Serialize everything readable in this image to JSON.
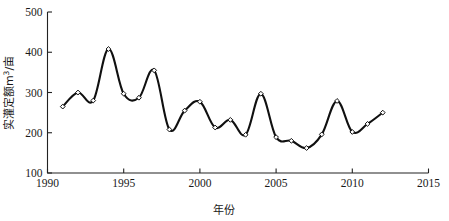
{
  "chart_data": {
    "type": "line",
    "title": "",
    "xlabel": "年份",
    "ylabel": "实灌定额m3/亩",
    "ylabel_base": "实灌定额m",
    "ylabel_sup": "3",
    "ylabel_tail": "/亩",
    "xlim": [
      1990,
      2015
    ],
    "ylim": [
      100,
      500
    ],
    "xticks": [
      1990,
      1995,
      2000,
      2005,
      2010,
      2015
    ],
    "xtick_labels": [
      "1990",
      "1995",
      "2000",
      "2005",
      "2010",
      "2015"
    ],
    "yticks": [
      100,
      200,
      300,
      400,
      500
    ],
    "ytick_labels": [
      "100",
      "200",
      "300",
      "400",
      "500"
    ],
    "grid": false,
    "legend": null,
    "marker": "diamond-open",
    "line_color": "#101010",
    "x": [
      1991,
      1992,
      1993,
      1994,
      1995,
      1996,
      1997,
      1998,
      1999,
      2000,
      2001,
      2002,
      2003,
      2004,
      2005,
      2006,
      2007,
      2008,
      2009,
      2010,
      2011,
      2012
    ],
    "values": [
      265,
      300,
      280,
      408,
      297,
      287,
      355,
      208,
      255,
      277,
      213,
      232,
      195,
      297,
      189,
      180,
      162,
      196,
      279,
      202,
      222,
      250
    ],
    "series": [
      {
        "name": "实灌定额",
        "values": [
          265,
          300,
          280,
          408,
          297,
          287,
          355,
          208,
          255,
          277,
          213,
          232,
          195,
          297,
          189,
          180,
          162,
          196,
          279,
          202,
          222,
          250
        ]
      }
    ]
  }
}
